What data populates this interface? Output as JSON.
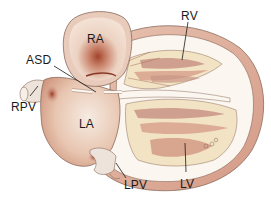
{
  "figure": {
    "width": 271,
    "height": 197
  },
  "labels": {
    "ra": {
      "text": "RA",
      "full": "Right atrium"
    },
    "rv": {
      "text": "RV",
      "full": "Right ventricle"
    },
    "asd": {
      "text": "ASD",
      "full": "Atrial septal defect"
    },
    "rpv": {
      "text": "RPV",
      "full": "Right pulmonary vein"
    },
    "la": {
      "text": "LA",
      "full": "Left atrium"
    },
    "lpv": {
      "text": "LPV",
      "full": "Left pulmonary vein"
    },
    "lv": {
      "text": "LV",
      "full": "Left ventricle"
    }
  },
  "colors": {
    "background": "#ffffff",
    "outline": "#8a6a5a",
    "chamber_light": "#f3e1d4",
    "chamber_mid": "#e2b9a0",
    "chamber_dark": "#a3432c",
    "muscle": "#d9a592",
    "trabeculae_light": "#f1e3c3",
    "trabeculae_dark": "#c99486",
    "vessel": "#ede3da",
    "leader_line": "#1a1a1a",
    "label_text": "#1a1a1a"
  }
}
